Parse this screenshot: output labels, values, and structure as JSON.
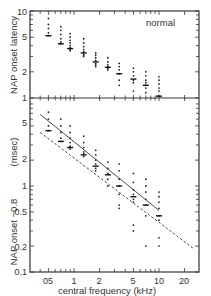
{
  "chart_data": [
    {
      "type": "scatter",
      "panel": "top",
      "title": "",
      "annotation": "normal",
      "xlabel": "central frequency (kHz)",
      "ylabel": "NAP onset latency",
      "xscale": "log",
      "yscale": "log",
      "xlim": [
        0.3,
        30
      ],
      "ylim": [
        1,
        10
      ],
      "ytick_labels": [
        "1",
        "2",
        "5",
        "10"
      ],
      "yticks": [
        1,
        2,
        5,
        10
      ],
      "grid": false,
      "series": [
        {
          "name": "individual points",
          "marker": "dot",
          "points": [
            [
              0.5,
              8.2
            ],
            [
              0.5,
              7.0
            ],
            [
              0.5,
              6.3
            ],
            [
              0.5,
              5.6
            ],
            [
              0.5,
              5.2
            ],
            [
              0.7,
              6.6
            ],
            [
              0.7,
              6.0
            ],
            [
              0.7,
              5.4
            ],
            [
              0.7,
              4.8
            ],
            [
              0.7,
              4.4
            ],
            [
              0.7,
              4.2
            ],
            [
              0.9,
              5.5
            ],
            [
              0.9,
              5.0
            ],
            [
              0.9,
              4.6
            ],
            [
              0.9,
              4.3
            ],
            [
              0.9,
              4.0
            ],
            [
              0.9,
              3.8
            ],
            [
              0.9,
              3.6
            ],
            [
              0.9,
              3.5
            ],
            [
              1.3,
              4.8
            ],
            [
              1.3,
              4.3
            ],
            [
              1.3,
              3.9
            ],
            [
              1.3,
              3.6
            ],
            [
              1.3,
              3.4
            ],
            [
              1.3,
              3.2
            ],
            [
              1.3,
              3.1
            ],
            [
              1.3,
              3.0
            ],
            [
              1.8,
              3.3
            ],
            [
              1.8,
              3.1
            ],
            [
              1.8,
              2.9
            ],
            [
              1.8,
              2.7
            ],
            [
              1.8,
              2.5
            ],
            [
              1.8,
              2.4
            ],
            [
              1.8,
              2.3
            ],
            [
              2.5,
              2.9
            ],
            [
              2.5,
              2.6
            ],
            [
              2.5,
              2.4
            ],
            [
              2.5,
              2.3
            ],
            [
              2.5,
              2.2
            ],
            [
              2.5,
              2.1
            ],
            [
              3.4,
              2.5
            ],
            [
              3.4,
              2.3
            ],
            [
              3.4,
              2.1
            ],
            [
              3.4,
              1.9
            ],
            [
              3.4,
              1.6
            ],
            [
              3.4,
              1.4
            ],
            [
              5.0,
              2.2
            ],
            [
              5.0,
              2.0
            ],
            [
              5.0,
              1.8
            ],
            [
              5.0,
              1.6
            ],
            [
              5.0,
              1.5
            ],
            [
              5.0,
              1.2
            ],
            [
              7.0,
              2.0
            ],
            [
              7.0,
              1.8
            ],
            [
              7.0,
              1.6
            ],
            [
              7.0,
              1.5
            ],
            [
              7.0,
              1.4
            ],
            [
              7.0,
              1.3
            ],
            [
              7.0,
              1.15
            ],
            [
              10.0,
              1.75
            ],
            [
              10.0,
              1.6
            ],
            [
              10.0,
              1.45
            ],
            [
              10.0,
              1.3
            ],
            [
              10.0,
              1.2
            ],
            [
              10.0,
              1.05
            ]
          ]
        },
        {
          "name": "median",
          "marker": "bar",
          "points": [
            [
              0.5,
              5.2
            ],
            [
              0.7,
              4.2
            ],
            [
              0.9,
              3.7
            ],
            [
              1.3,
              3.3
            ],
            [
              1.8,
              2.6
            ],
            [
              2.5,
              2.25
            ],
            [
              3.4,
              1.9
            ],
            [
              5.0,
              1.65
            ],
            [
              7.0,
              1.4
            ],
            [
              10.0,
              1.05
            ]
          ]
        }
      ]
    },
    {
      "type": "scatter",
      "panel": "bottom",
      "title": "",
      "xlabel": "central frequency (kHz)",
      "ylabel": "NAP onset −0.8 (msec)",
      "xscale": "log",
      "yscale": "log",
      "xlim": [
        0.3,
        30
      ],
      "ylim": [
        0.1,
        10
      ],
      "xticks": [
        0.5,
        1,
        2,
        5,
        10,
        20
      ],
      "xtick_labels": [
        "05",
        "1",
        "2",
        "5",
        "10",
        "20"
      ],
      "yticks": [
        0.1,
        0.2,
        0.5,
        1,
        2,
        5
      ],
      "ytick_labels": [
        "0.1",
        "0.2",
        "0.5",
        "1",
        "2",
        "5"
      ],
      "grid": false,
      "series": [
        {
          "name": "individual points",
          "marker": "dot",
          "points": [
            [
              0.5,
              7.2
            ],
            [
              0.5,
              6.0
            ],
            [
              0.5,
              5.0
            ],
            [
              0.5,
              4.4
            ],
            [
              0.7,
              6.0
            ],
            [
              0.7,
              5.0
            ],
            [
              0.7,
              4.2
            ],
            [
              0.7,
              3.6
            ],
            [
              0.7,
              3.3
            ],
            [
              0.9,
              5.0
            ],
            [
              0.9,
              4.2
            ],
            [
              0.9,
              3.6
            ],
            [
              0.9,
              3.2
            ],
            [
              0.9,
              2.9
            ],
            [
              0.9,
              2.7
            ],
            [
              1.3,
              3.8
            ],
            [
              1.3,
              3.2
            ],
            [
              1.3,
              2.8
            ],
            [
              1.3,
              2.5
            ],
            [
              1.3,
              2.4
            ],
            [
              1.3,
              2.2
            ],
            [
              1.8,
              2.6
            ],
            [
              1.8,
              2.3
            ],
            [
              1.8,
              2.0
            ],
            [
              1.8,
              1.8
            ],
            [
              1.8,
              1.6
            ],
            [
              1.8,
              1.5
            ],
            [
              2.5,
              1.9
            ],
            [
              2.5,
              1.6
            ],
            [
              2.5,
              1.4
            ],
            [
              2.5,
              1.2
            ],
            [
              2.5,
              1.0
            ],
            [
              3.4,
              1.8
            ],
            [
              3.4,
              1.5
            ],
            [
              3.4,
              1.2
            ],
            [
              3.4,
              1.0
            ],
            [
              3.4,
              0.8
            ],
            [
              3.4,
              0.6
            ],
            [
              3.4,
              0.55
            ],
            [
              5.0,
              1.4
            ],
            [
              5.0,
              1.1
            ],
            [
              5.0,
              0.9
            ],
            [
              5.0,
              0.8
            ],
            [
              5.0,
              0.7
            ],
            [
              5.0,
              0.65
            ],
            [
              5.0,
              0.35
            ],
            [
              5.0,
              0.3
            ],
            [
              7.0,
              1.2
            ],
            [
              7.0,
              1.0
            ],
            [
              7.0,
              0.85
            ],
            [
              7.0,
              0.7
            ],
            [
              7.0,
              0.6
            ],
            [
              7.0,
              0.45
            ],
            [
              7.0,
              0.2
            ],
            [
              10.0,
              0.85
            ],
            [
              10.0,
              0.75
            ],
            [
              10.0,
              0.65
            ],
            [
              10.0,
              0.55
            ],
            [
              10.0,
              0.45
            ],
            [
              10.0,
              0.4
            ],
            [
              10.0,
              0.25
            ],
            [
              10.0,
              0.2
            ]
          ]
        },
        {
          "name": "median",
          "marker": "bar",
          "points": [
            [
              0.5,
              4.4
            ],
            [
              0.7,
              3.3
            ],
            [
              0.9,
              2.8
            ],
            [
              1.3,
              2.3
            ],
            [
              1.8,
              1.7
            ],
            [
              2.5,
              1.35
            ],
            [
              3.4,
              1.0
            ],
            [
              5.0,
              0.75
            ],
            [
              7.0,
              0.6
            ],
            [
              10.0,
              0.45
            ]
          ]
        },
        {
          "name": "regression fit",
          "style": "solid line",
          "points": [
            [
              0.4,
              6.8
            ],
            [
              10.0,
              0.52
            ]
          ]
        },
        {
          "name": "lower bound",
          "style": "dashed line",
          "points": [
            [
              0.4,
              4.2
            ],
            [
              25.0,
              0.19
            ]
          ]
        }
      ]
    }
  ],
  "labels": {
    "annotation": "normal",
    "top_ylabel": "NAP onset latency",
    "bottom_ylabel": "NAP onset −0.8",
    "bottom_ylabel_unit": "(msec)",
    "xlabel": "central frequency (kHz)",
    "top_yticks": [
      "10",
      "5",
      "2",
      "1"
    ],
    "bottom_yticks": [
      "5",
      "2",
      "1",
      "0.5",
      "0.2",
      "0.1"
    ],
    "xticks": [
      "05",
      "1",
      "2",
      "5",
      "10",
      "20"
    ]
  }
}
